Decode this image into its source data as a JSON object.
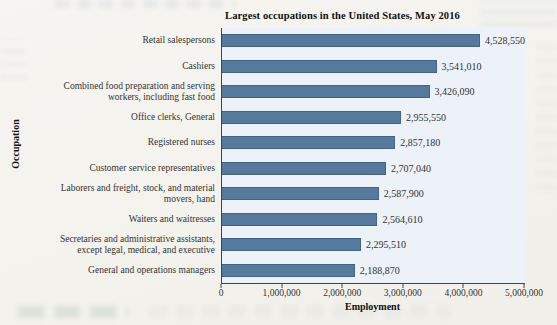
{
  "page": {
    "title": "Largest occupations in the United States, May 2016",
    "xlabel": "Employment",
    "ylabel": "Occupation"
  },
  "chart_data": {
    "type": "bar",
    "orientation": "horizontal",
    "title": "Largest occupations in the United States, May 2016",
    "xlabel": "Employment",
    "ylabel": "Occupation",
    "xlim": [
      0,
      5000000
    ],
    "x_ticks": [
      "0",
      "1,000,000",
      "2,000,000",
      "3,000,000",
      "4,000,000",
      "5,000,000"
    ],
    "grid": false,
    "legend": false,
    "categories": [
      "Retail salespersons",
      "Cashiers",
      "Combined food preparation and serving\nworkers, including fast food",
      "Office clerks, General",
      "Registered nurses",
      "Customer service representatives",
      "Laborers and freight, stock, and material\nmovers, hand",
      "Waiters and waitresses",
      "Secretaries and administrative assistants,\nexcept legal, medical, and executive",
      "General and operations managers"
    ],
    "values": [
      4528550,
      3541010,
      3426090,
      2955550,
      2857180,
      2707040,
      2587900,
      2564610,
      2295510,
      2188870
    ],
    "value_labels": [
      "4,528,550",
      "3,541,010",
      "3,426,090",
      "2,955,550",
      "2,857,180",
      "2,707,040",
      "2,587,900",
      "2,564,610",
      "2,295,510",
      "2,188,870"
    ],
    "colors": {
      "bar": "#567a9e",
      "bar_border": "#43648a",
      "plot_background": "#edf1f8",
      "axis": "#444444",
      "text": "#333333",
      "title": "#111111"
    }
  }
}
